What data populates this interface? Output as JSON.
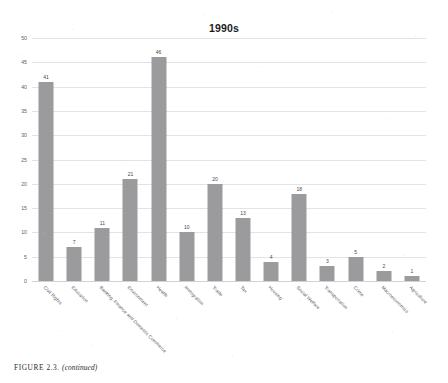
{
  "figure": {
    "caption_label": "FIGURE 2.3.",
    "caption_continued": "(continued)"
  },
  "chart_data": {
    "type": "bar",
    "title": "1990s",
    "xlabel": "",
    "ylabel": "",
    "ylim": [
      0,
      50
    ],
    "yticks": [
      0,
      5,
      10,
      15,
      20,
      25,
      30,
      35,
      40,
      45,
      50
    ],
    "grid": true,
    "legend": "none",
    "bar_color": "#9b9b9d",
    "categories": [
      "Civil Rights",
      "Education",
      "Banking, Finance and Domestic Commerce",
      "Environment",
      "Health",
      "Immigration",
      "Trade",
      "Tax",
      "Housing",
      "Social Welfare",
      "Transportation",
      "Crime",
      "Macroeconomics",
      "Agriculture"
    ],
    "values": [
      41,
      7,
      11,
      21,
      46,
      10,
      20,
      13,
      4,
      18,
      3,
      5,
      2,
      1
    ],
    "data_labels": [
      "41",
      "7",
      "11",
      "21",
      "46",
      "10",
      "20",
      "13",
      "4",
      "18",
      "3",
      "5",
      "2",
      "1"
    ]
  }
}
